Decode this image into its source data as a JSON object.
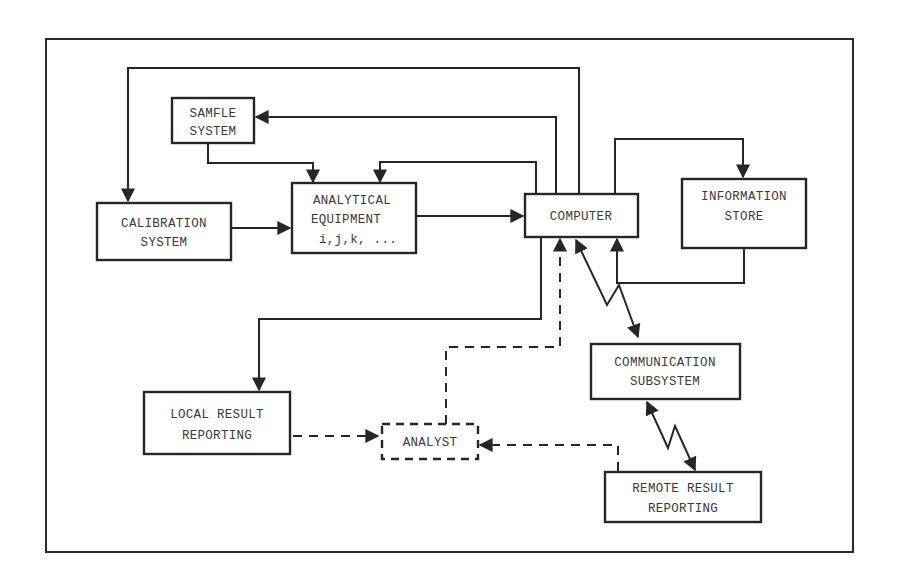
{
  "diagram": {
    "colors": {
      "ink": "#262626",
      "text": "#3a3a3a",
      "background": "#ffffff"
    },
    "nodes": {
      "sample_system": {
        "lines": [
          "SAMFLE",
          "SYSTEM"
        ],
        "style": "solid"
      },
      "calibration_system": {
        "lines": [
          "CALIBRATION",
          "SYSTEM"
        ],
        "style": "solid"
      },
      "analytical_equipment": {
        "lines": [
          "ANALYTICAL",
          "EQUIPMENT",
          "i,j,k, ..."
        ],
        "style": "solid"
      },
      "computer": {
        "lines": [
          "COMPUTER"
        ],
        "style": "solid"
      },
      "information_store": {
        "lines": [
          "INFORMATION",
          "STORE"
        ],
        "style": "solid"
      },
      "communication_subsystem": {
        "lines": [
          "COMMUNICATION",
          "SUBSYSTEM"
        ],
        "style": "solid"
      },
      "local_result_reporting": {
        "lines": [
          "LOCAL RESULT",
          "REPORTING"
        ],
        "style": "solid"
      },
      "analyst": {
        "lines": [
          "ANALYST"
        ],
        "style": "dashed"
      },
      "remote_result_reporting": {
        "lines": [
          "REMOTE RESULT",
          "REPORTING"
        ],
        "style": "solid"
      }
    },
    "edges": [
      {
        "from": "computer",
        "to": "calibration_system",
        "style": "solid"
      },
      {
        "from": "computer",
        "to": "sample_system",
        "style": "solid"
      },
      {
        "from": "sample_system",
        "to": "analytical_equipment",
        "style": "solid"
      },
      {
        "from": "computer",
        "to": "analytical_equipment",
        "style": "solid"
      },
      {
        "from": "calibration_system",
        "to": "analytical_equipment",
        "style": "solid"
      },
      {
        "from": "analytical_equipment",
        "to": "computer",
        "style": "solid"
      },
      {
        "from": "computer",
        "to": "information_store",
        "style": "solid"
      },
      {
        "from": "information_store",
        "to": "computer",
        "style": "solid"
      },
      {
        "from": "computer",
        "to": "local_result_reporting",
        "style": "solid"
      },
      {
        "from": "computer",
        "to": "communication_subsystem",
        "style": "lightning-bidirectional"
      },
      {
        "from": "communication_subsystem",
        "to": "remote_result_reporting",
        "style": "lightning-bidirectional"
      },
      {
        "from": "local_result_reporting",
        "to": "analyst",
        "style": "dashed"
      },
      {
        "from": "remote_result_reporting",
        "to": "analyst",
        "style": "dashed"
      },
      {
        "from": "analyst",
        "to": "computer",
        "style": "dashed"
      }
    ]
  }
}
